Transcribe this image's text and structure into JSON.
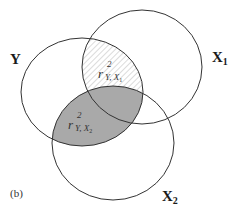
{
  "panel_label": "(b)",
  "colors": {
    "outline": "#333333",
    "shaded_fill": "#a9a9a9",
    "hatch_stroke": "#b8b8b8",
    "background": "#ffffff"
  },
  "sets": [
    {
      "id": "Y",
      "label": "Y",
      "subscript": ""
    },
    {
      "id": "X1",
      "label": "X",
      "subscript": "1"
    },
    {
      "id": "X2",
      "label": "X",
      "subscript": "2"
    }
  ],
  "regions": [
    {
      "id": "hatched",
      "description": "Y ∩ X1 (excluding X2)",
      "base": "r",
      "superscript": "2",
      "subscript": "Y, X",
      "sub_index": "1",
      "style": "hatched"
    },
    {
      "id": "shaded",
      "description": "Y ∩ X2",
      "base": "r",
      "superscript": "2",
      "subscript": "Y, X",
      "sub_index": "2",
      "style": "shaded"
    }
  ]
}
